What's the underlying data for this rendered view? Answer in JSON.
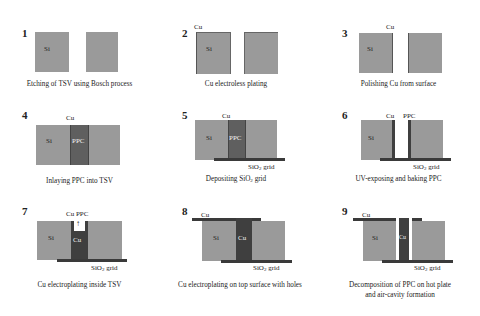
{
  "diagram": {
    "type": "process-flow",
    "steps": [
      {
        "number": "1",
        "caption": "Etching of TSV using Bosch process",
        "labels": [
          "Si"
        ]
      },
      {
        "number": "2",
        "caption": "Cu electroless plating",
        "labels": [
          "Cu",
          "Si"
        ]
      },
      {
        "number": "3",
        "caption": "Polishing Cu from surface",
        "labels": [
          "Cu",
          "Si"
        ]
      },
      {
        "number": "4",
        "caption": "Inlaying PPC into TSV",
        "labels": [
          "Cu",
          "Si",
          "PPC"
        ]
      },
      {
        "number": "5",
        "caption_pre": "Depositing SiO",
        "caption_sub": "2",
        "caption_post": " grid",
        "labels": [
          "Cu",
          "Si",
          "PPC"
        ],
        "grid_label": {
          "pre": "SiO",
          "sub": "2",
          "post": " grid"
        }
      },
      {
        "number": "6",
        "caption": "UV-exposing and baking PPC",
        "labels": [
          "Cu",
          "PPC",
          "Si"
        ],
        "grid_label": {
          "pre": "SiO",
          "sub": "2",
          "post": " grid"
        }
      },
      {
        "number": "7",
        "caption": "Cu electroplating inside TSV",
        "labels": [
          "Cu PPC",
          "Si",
          "Cu"
        ],
        "arrow": "↑",
        "grid_label": {
          "pre": "SiO",
          "sub": "2",
          "post": " grid"
        }
      },
      {
        "number": "8",
        "caption": "Cu electroplating on top surface with holes",
        "labels": [
          "Cu",
          "Si",
          "Cu"
        ],
        "grid_label": {
          "pre": "SiO",
          "sub": "2",
          "post": " grid"
        }
      },
      {
        "number": "9",
        "caption_line1": "Decomposition of PPC on hot plate",
        "caption_line2": "and air-cavity formation",
        "labels": [
          "Cu",
          "Si",
          "Cu"
        ],
        "grid_label": {
          "pre": "SiO",
          "sub": "2",
          "post": " grid"
        }
      }
    ]
  },
  "colors": {
    "silicon": "#9a9a9a",
    "ppc": "#5f5f5f",
    "copper": "#3f3f3f",
    "sio2_grid": "#3a3a3a",
    "background": "#ffffff"
  }
}
